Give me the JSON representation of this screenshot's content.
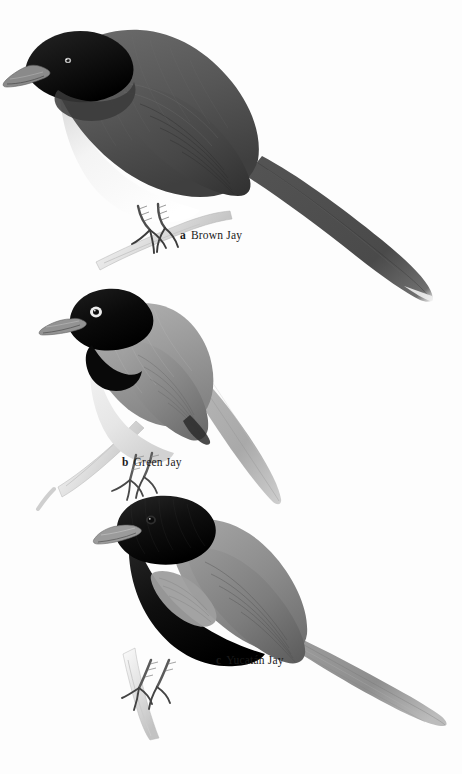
{
  "plate": {
    "kind": "field-guide-plate",
    "background_color": "#fdfdfd",
    "width": 462,
    "height": 774,
    "subject": "jays"
  },
  "figures": [
    {
      "letter": "a",
      "name": "Brown Jay",
      "label_x": 180,
      "label_y": 229,
      "plumage": {
        "head": "#111111",
        "bill": "#7e7e7e",
        "eye": "#cfcfcf",
        "upperparts": "#595959",
        "wing": "#4a4a4a",
        "underparts": "#f2f2f2",
        "tail": "#5a5a5a",
        "tail_tip": "#efefef",
        "legs": "#555555",
        "perch": "#d8d8d8"
      }
    },
    {
      "letter": "b",
      "name": "Green Jay",
      "label_x": 122,
      "label_y": 456,
      "plumage": {
        "head": "#0d0d0d",
        "bill": "#8a8a8a",
        "eye": "#e8e8e8",
        "upperparts": "#9b9b9b",
        "wing": "#8a8a8a",
        "underparts": "#ededed",
        "tail": "#b4b4b4",
        "tail_tip": "#e4e4e4",
        "legs": "#6a6a6a",
        "perch": "#d4d4d4"
      }
    },
    {
      "letter": "c",
      "name": "Yucatán Jay",
      "label_x": 216,
      "label_y": 654,
      "plumage": {
        "head": "#0b0b0b",
        "bill": "#9a9a9a",
        "eye": "#2a2a2a",
        "upperparts": "#8f8f8f",
        "wing": "#7c7c7c",
        "underparts": "#141414",
        "tail": "#9a9a9a",
        "tail_tip": "#c8c8c8",
        "legs": "#6e6e6e",
        "perch": "#d6d6d6"
      }
    }
  ]
}
